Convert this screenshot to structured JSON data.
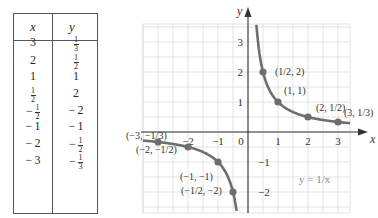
{
  "table": {
    "headers": [
      "x",
      "y"
    ],
    "rows": [
      {
        "x": "3",
        "y": "1/3"
      },
      {
        "x": "2",
        "y": "1/2"
      },
      {
        "x": "1",
        "y": "1"
      },
      {
        "x": "1/2",
        "y": "2"
      },
      {
        "x": "-1/2",
        "y": "-2"
      },
      {
        "x": "-1",
        "y": "-1"
      },
      {
        "x": "-2",
        "y": "-1/2"
      },
      {
        "x": "-3",
        "y": "-1/3"
      }
    ]
  },
  "chart_data": {
    "type": "line",
    "title": "",
    "function_label": "y = 1/x",
    "xlabel": "x",
    "ylabel": "y",
    "xlim": [
      -3.5,
      3.4
    ],
    "ylim": [
      -2.7,
      3.6
    ],
    "grid": true,
    "grid_step": 0.5,
    "x_ticks": [
      "-2",
      "-1",
      "0",
      "1",
      "2",
      "3"
    ],
    "y_ticks": [
      "-2",
      "-1",
      "1",
      "2",
      "3"
    ],
    "series": [
      {
        "name": "y = 1/x",
        "branch": "positive",
        "x_range": [
          0.28,
          3.4
        ]
      },
      {
        "name": "y = 1/x",
        "branch": "negative",
        "x_range": [
          -3.5,
          -0.38
        ]
      }
    ],
    "points": [
      {
        "x": 0.5,
        "y": 2,
        "label": "(1/2, 2)"
      },
      {
        "x": 1,
        "y": 1,
        "label": "(1, 1)"
      },
      {
        "x": 2,
        "y": 0.5,
        "label": "(2, 1/2)"
      },
      {
        "x": 3,
        "y": 0.3333,
        "label": "(3, 1/3)"
      },
      {
        "x": -3,
        "y": -0.3333,
        "label": "(-3, -1/3)"
      },
      {
        "x": -2,
        "y": -0.5,
        "label": "(-2, -1/2)"
      },
      {
        "x": -1,
        "y": -1,
        "label": "(-1, -1)"
      },
      {
        "x": -0.5,
        "y": -2,
        "label": "(-1/2, -2)"
      }
    ],
    "colors": {
      "curve": "#6e6e6e",
      "grid": "#dcdcdc",
      "axis": "#333333",
      "label_fn": "#8a8a8a"
    }
  }
}
